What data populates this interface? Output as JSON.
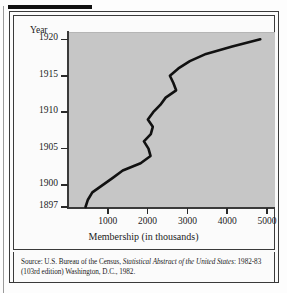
{
  "figure": {
    "source_prefix": "Source: U.S. Bureau of the Census, ",
    "source_italic": "Statistical Abstract of the United States",
    "source_suffix": ": 1982-83 (103rd edition) Washington, D.C., 1982."
  },
  "chart_data": {
    "type": "line",
    "title": "",
    "xlabel": "Membership (in thousands)",
    "ylabel": "Year",
    "xlim": [
      0,
      5200
    ],
    "ylim": [
      1897,
      1921
    ],
    "xticks": [
      1000,
      2000,
      3000,
      4000,
      5000
    ],
    "xtick_labels": [
      "1000",
      "2000",
      "3000",
      "4000",
      "5000"
    ],
    "yticks": [
      1897,
      1900,
      1905,
      1910,
      1915,
      1920
    ],
    "ytick_labels": [
      "1897",
      "1900",
      "1905",
      "1910",
      "1915",
      "1920"
    ],
    "grid": false,
    "legend": null,
    "plot_background": "#c6c6c6",
    "line_color": "#111111",
    "series": [
      {
        "name": "Union membership",
        "x_label": "Membership (in thousands)",
        "y_label": "Year",
        "points": [
          {
            "year": 1897,
            "membership": 440
          },
          {
            "year": 1898,
            "membership": 500
          },
          {
            "year": 1899,
            "membership": 611
          },
          {
            "year": 1900,
            "membership": 868
          },
          {
            "year": 1901,
            "membership": 1125
          },
          {
            "year": 1902,
            "membership": 1375
          },
          {
            "year": 1903,
            "membership": 1824
          },
          {
            "year": 1904,
            "membership": 2073
          },
          {
            "year": 1905,
            "membership": 2022
          },
          {
            "year": 1906,
            "membership": 1907
          },
          {
            "year": 1907,
            "membership": 2080
          },
          {
            "year": 1908,
            "membership": 2130
          },
          {
            "year": 1909,
            "membership": 2006
          },
          {
            "year": 1910,
            "membership": 2140
          },
          {
            "year": 1911,
            "membership": 2318
          },
          {
            "year": 1912,
            "membership": 2453
          },
          {
            "year": 1913,
            "membership": 2716
          },
          {
            "year": 1914,
            "membership": 2647
          },
          {
            "year": 1915,
            "membership": 2560
          },
          {
            "year": 1916,
            "membership": 2773
          },
          {
            "year": 1917,
            "membership": 3061
          },
          {
            "year": 1918,
            "membership": 3467
          },
          {
            "year": 1919,
            "membership": 4125
          },
          {
            "year": 1920,
            "membership": 4830
          }
        ]
      }
    ]
  }
}
